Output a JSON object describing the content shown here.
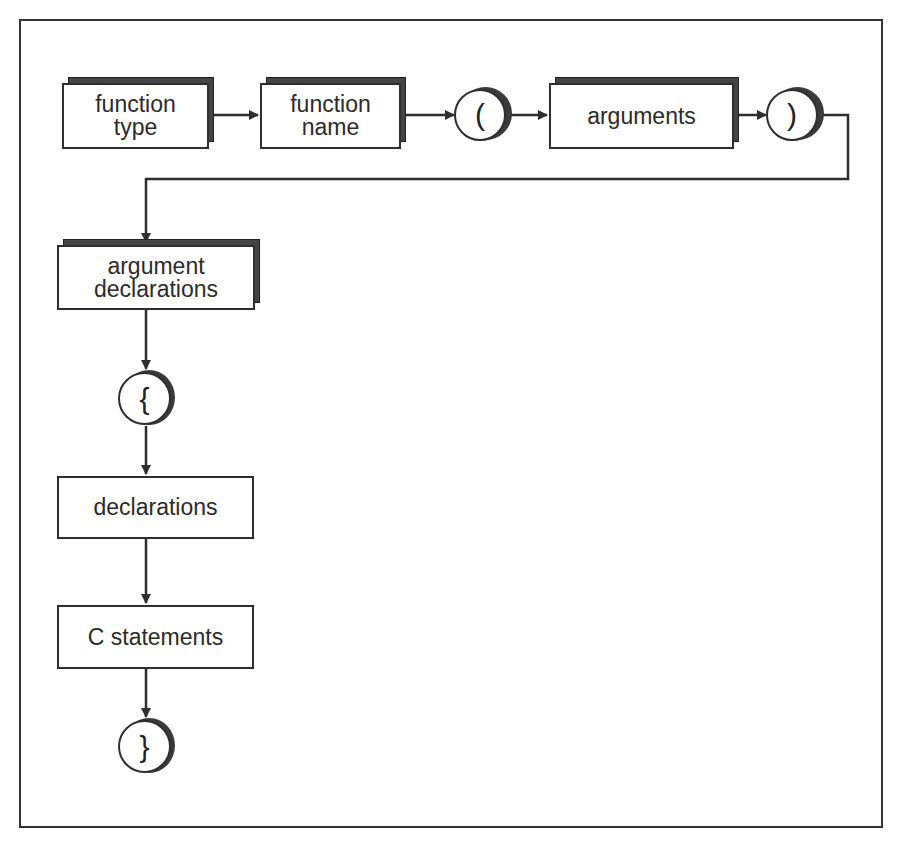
{
  "diagram": {
    "title": "",
    "type": "syntax-flow",
    "nodes": [
      {
        "id": "function_type",
        "label": "function\ntype",
        "shape": "stacked-box"
      },
      {
        "id": "function_name",
        "label": "function\nname",
        "shape": "stacked-box"
      },
      {
        "id": "open_paren",
        "label": "(",
        "shape": "circle"
      },
      {
        "id": "arguments",
        "label": "arguments",
        "shape": "stacked-box"
      },
      {
        "id": "close_paren",
        "label": ")",
        "shape": "circle"
      },
      {
        "id": "argument_declarations",
        "label": "argument\ndeclarations",
        "shape": "stacked-box"
      },
      {
        "id": "open_brace",
        "label": "{",
        "shape": "circle"
      },
      {
        "id": "declarations",
        "label": "declarations",
        "shape": "box"
      },
      {
        "id": "c_statements",
        "label": "C statements",
        "shape": "box"
      },
      {
        "id": "close_brace",
        "label": "}",
        "shape": "circle"
      }
    ],
    "edges": [
      {
        "from": "function_type",
        "to": "function_name"
      },
      {
        "from": "function_name",
        "to": "open_paren"
      },
      {
        "from": "open_paren",
        "to": "arguments"
      },
      {
        "from": "arguments",
        "to": "close_paren"
      },
      {
        "from": "close_paren",
        "to": "argument_declarations"
      },
      {
        "from": "argument_declarations",
        "to": "open_brace"
      },
      {
        "from": "open_brace",
        "to": "declarations"
      },
      {
        "from": "declarations",
        "to": "c_statements"
      },
      {
        "from": "c_statements",
        "to": "close_brace"
      }
    ]
  },
  "colors": {
    "stroke": "#2e2e2e",
    "shadow": "#3a3a3a",
    "background": "#ffffff"
  }
}
